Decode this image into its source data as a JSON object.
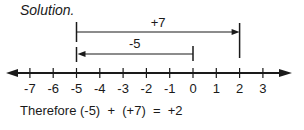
{
  "heading": "Solution.",
  "conclusion": "Therefore (-5)  +  (+7)  =  +2",
  "number_line": {
    "ticks": [
      "-7",
      "-6",
      "-5",
      "-4",
      "-3",
      "-2",
      "-1",
      "0",
      "1",
      "2",
      "3"
    ],
    "min_visible": -7,
    "max_visible": 3
  },
  "arrows": {
    "plus7": {
      "label": "+7",
      "from": -5,
      "to": 2
    },
    "minus5": {
      "label": "-5",
      "from": 0,
      "to": -5
    }
  },
  "colors": {
    "ink": "#1a1a1a",
    "background": "#ffffff"
  }
}
